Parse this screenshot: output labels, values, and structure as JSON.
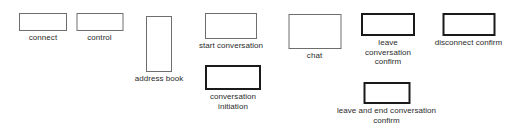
{
  "diagram": {
    "type": "ui-screen-map",
    "background_color": "#ffffff",
    "label_color": "#2b2b2b",
    "thin_border_color": "#6e6e6e",
    "thick_border_color": "#1a1a1a",
    "nodes": [
      {
        "id": "connect",
        "label_lines": [
          "connect"
        ],
        "border": "thin",
        "x": 19,
        "y": 13,
        "w": 48,
        "h": 18,
        "label_y": 33
      },
      {
        "id": "control",
        "label_lines": [
          "control"
        ],
        "border": "thin",
        "x": 76,
        "y": 13,
        "w": 47,
        "h": 18,
        "label_y": 33
      },
      {
        "id": "address-book",
        "label_lines": [
          "address book"
        ],
        "border": "thin",
        "x": 146,
        "y": 16,
        "w": 26,
        "h": 56,
        "label_y": 74
      },
      {
        "id": "start-conversation",
        "label_lines": [
          "start conversation"
        ],
        "border": "thin",
        "x": 205,
        "y": 13,
        "w": 52,
        "h": 26,
        "label_y": 41
      },
      {
        "id": "conversation-initiation",
        "label_lines": [
          "conversation",
          "initiation"
        ],
        "border": "thick",
        "x": 205,
        "y": 65,
        "w": 56,
        "h": 25,
        "label_y": 92
      },
      {
        "id": "chat",
        "label_lines": [
          "chat"
        ],
        "border": "thin",
        "x": 288,
        "y": 14,
        "w": 53,
        "h": 35,
        "label_y": 51
      },
      {
        "id": "leave-conversation-confirm",
        "label_lines": [
          "leave",
          "conversation",
          "confirm"
        ],
        "border": "thick",
        "x": 361,
        "y": 13,
        "w": 54,
        "h": 23,
        "label_y": 38
      },
      {
        "id": "disconnect-confirm",
        "label_lines": [
          "disconnect confirm"
        ],
        "border": "thick",
        "x": 442,
        "y": 13,
        "w": 53,
        "h": 23,
        "label_y": 38
      },
      {
        "id": "leave-and-end-conversation-confirm",
        "label_lines": [
          "leave and end conversation",
          "confirm"
        ],
        "border": "thick",
        "x": 363,
        "y": 82,
        "w": 47,
        "h": 22,
        "label_y": 106
      }
    ]
  }
}
